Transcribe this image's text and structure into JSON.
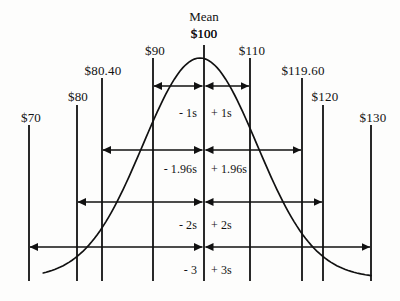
{
  "figure": {
    "background_color": "#fdfdfc",
    "ink_color": "#111111"
  },
  "mean_marker": {
    "caption": "Mean",
    "value_label": "$100"
  },
  "axis_labels": [
    {
      "name": "tick-70",
      "text": "$70",
      "x": 29,
      "label_x": 31,
      "label_y": 111,
      "line_top": 125,
      "anchor": "center"
    },
    {
      "name": "tick-80",
      "text": "$80",
      "x": 77,
      "label_x": 78,
      "label_y": 90,
      "line_top": 105,
      "anchor": "center"
    },
    {
      "name": "tick-80-40",
      "text": "$80.40",
      "x": 102,
      "label_x": 103,
      "label_y": 64,
      "line_top": 78,
      "anchor": "center"
    },
    {
      "name": "tick-90",
      "text": "$90",
      "x": 153,
      "label_x": 155,
      "label_y": 44,
      "line_top": 58,
      "anchor": "center"
    },
    {
      "name": "tick-100",
      "text": "$100",
      "x": 204,
      "label_x": 204,
      "label_y": 27,
      "line_top": 45,
      "anchor": "center"
    },
    {
      "name": "tick-110",
      "text": "$110",
      "x": 250,
      "label_x": 252,
      "label_y": 44,
      "line_top": 58,
      "anchor": "center"
    },
    {
      "name": "tick-119-60",
      "text": "$119.60",
      "x": 302,
      "label_x": 303,
      "label_y": 64,
      "line_top": 78,
      "anchor": "center"
    },
    {
      "name": "tick-120",
      "text": "$120",
      "x": 323,
      "label_x": 325,
      "label_y": 90,
      "line_top": 105,
      "anchor": "center"
    },
    {
      "name": "tick-130",
      "text": "$130",
      "x": 371,
      "label_x": 373,
      "label_y": 111,
      "line_top": 125,
      "anchor": "center"
    }
  ],
  "interval_rows": [
    {
      "name": "one-sigma",
      "left_label": "- 1s",
      "right_label": "+ 1s",
      "arrow_y": 86,
      "label_y": 107,
      "left_x": 153,
      "right_x": 250,
      "center_x": 204
    },
    {
      "name": "one-point-nine-six-sigma",
      "left_label": "- 1.96s",
      "right_label": "+ 1.96s",
      "arrow_y": 150,
      "label_y": 163,
      "left_x": 102,
      "right_x": 302,
      "center_x": 204
    },
    {
      "name": "two-sigma",
      "left_label": "- 2s",
      "right_label": "+ 2s",
      "arrow_y": 202,
      "label_y": 219,
      "left_x": 77,
      "right_x": 323,
      "center_x": 204
    },
    {
      "name": "three-sigma",
      "left_label": "- 3",
      "right_label": "+ 3s",
      "arrow_y": 247,
      "label_y": 264,
      "left_x": 29,
      "right_x": 371,
      "center_x": 204
    }
  ],
  "chart_data": {
    "type": "line",
    "xlabel": "",
    "ylabel": "",
    "xlim": [
      65,
      135
    ],
    "distribution": {
      "mean": 100,
      "std_dev": 10,
      "curve_peak_x": 204,
      "curve_peak_y": 58,
      "curve_baseline_y": 278,
      "curve_left_end_x": 42,
      "curve_right_end_x": 371
    },
    "x": [
      70,
      80,
      80.4,
      90,
      100,
      110,
      119.6,
      120,
      130
    ],
    "tick_labels": [
      "$70",
      "$80",
      "$80.40",
      "$90",
      "$100",
      "$110",
      "$119.60",
      "$120",
      "$130"
    ],
    "annotations": [
      {
        "label": "Mean",
        "value": "$100",
        "z": 0
      },
      {
        "label": "- 1s",
        "value": "$90",
        "z": -1
      },
      {
        "label": "+ 1s",
        "value": "$110",
        "z": 1
      },
      {
        "label": "- 1.96s",
        "value": "$80.40",
        "z": -1.96
      },
      {
        "label": "+ 1.96s",
        "value": "$119.60",
        "z": 1.96
      },
      {
        "label": "- 2s",
        "value": "$80",
        "z": -2
      },
      {
        "label": "+ 2s",
        "value": "$120",
        "z": 2
      },
      {
        "label": "- 3",
        "value": "$70",
        "z": -3
      },
      {
        "label": "+ 3s",
        "value": "$130",
        "z": 3
      }
    ],
    "grid": false,
    "legend": "none"
  }
}
